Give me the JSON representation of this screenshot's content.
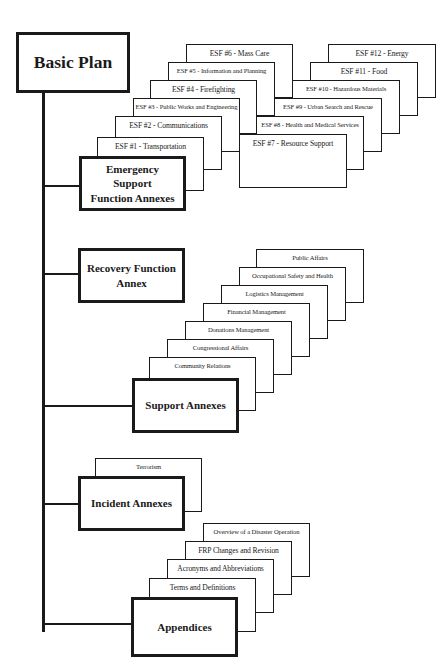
{
  "diagram": {
    "root": {
      "label": "Basic Plan"
    },
    "groups": [
      {
        "id": "esf",
        "label": "Emergency Support Function Annexes",
        "label_line1": "Emergency Support",
        "label_line2": "Function Annexes",
        "stacks": [
          {
            "items": [
              "ESF #1 - Transportation",
              "ESF #2 - Communications",
              "ESF #3 - Public Works and Engineering",
              "ESF #4 - Firefighting",
              "ESF #5 - Information and Planning",
              "ESF #6 - Mass Care"
            ]
          },
          {
            "items": [
              "ESF #7 - Resource Support",
              "ESF #8 - Health and Medical Services",
              "ESF #9 - Urban Search and Rescue",
              "ESF #10 - Hazardous Materials",
              "ESF #11 - Food",
              "ESF #12 - Energy"
            ]
          }
        ]
      },
      {
        "id": "recovery",
        "label": "Recovery Function Annex",
        "label_line1": "Recovery Function",
        "label_line2": "Annex",
        "items": []
      },
      {
        "id": "support",
        "label": "Support Annexes",
        "items": [
          "Community Relations",
          "Congressional Affairs",
          "Donations Management",
          "Financial Management",
          "Logistics Management",
          "Occupational Safety and Health",
          "Public Affairs"
        ]
      },
      {
        "id": "incident",
        "label": "Incident Annexes",
        "items": [
          "Terrorism"
        ]
      },
      {
        "id": "appendices",
        "label": "Appendices",
        "items": [
          "Terms and Definitions",
          "Acronyms and Abbreviations",
          "FRP Changes and Revision",
          "Overview of a Disaster Operation"
        ]
      }
    ],
    "colors": {
      "line": "#1a1a1a",
      "background": "#ffffff"
    }
  }
}
